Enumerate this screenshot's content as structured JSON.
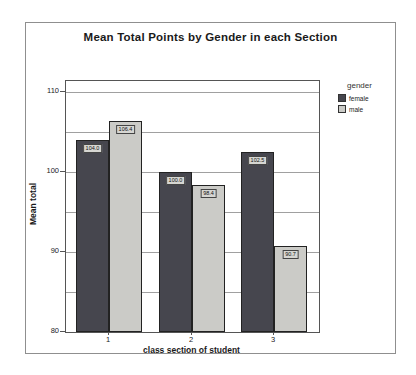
{
  "legend": {
    "title": "gender",
    "items": [
      {
        "label": "female",
        "color": "#46464e"
      },
      {
        "label": "male",
        "color": "#cbcbc7"
      }
    ]
  },
  "chart_data": {
    "type": "bar",
    "title": "Mean Total Points by Gender in each Section",
    "xlabel": "class section of student",
    "ylabel": "Mean total",
    "categories": [
      "1",
      "2",
      "3"
    ],
    "series": [
      {
        "name": "female",
        "color": "#46464e",
        "values": [
          104.0,
          100.0,
          102.5
        ],
        "bar_labels": [
          "104.0",
          "100.0",
          "102.5"
        ]
      },
      {
        "name": "male",
        "color": "#cbcbc7",
        "values": [
          106.4,
          98.4,
          90.7
        ],
        "bar_labels": [
          "106.4",
          "98.4",
          "90.7"
        ]
      }
    ],
    "ylim": [
      80,
      111.4
    ],
    "yticks": [
      110,
      100,
      90,
      80
    ],
    "ytick_labels": [
      "110",
      "100",
      "90",
      "80"
    ],
    "minor_grid_step": 5,
    "grid": true,
    "legend_position": "right"
  }
}
